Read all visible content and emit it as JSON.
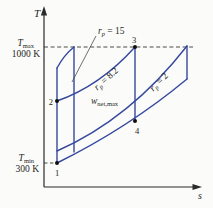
{
  "figure": {
    "background": "#fbfbf9",
    "line_blue": "#35489e",
    "axis_color": "#2b2b2b",
    "axis": {
      "y_label": "T",
      "x_label": "s"
    },
    "tmax": {
      "sym": "T",
      "sub": "max",
      "value": "1000 K"
    },
    "tmin": {
      "sym": "T",
      "sub": "min",
      "value": "300 K"
    },
    "labels": {
      "rp15": {
        "sym": "r",
        "sub": "p",
        "rest": " = 15"
      },
      "rp82": {
        "sym": "r",
        "sub": "p",
        "rest": " = 8.2"
      },
      "rp2": {
        "sym": "r",
        "sub": "p",
        "rest": " = 2"
      },
      "wnet": {
        "sym": "w",
        "sub": "net,max"
      }
    },
    "points": {
      "p1": "1",
      "p2": "2",
      "p3": "3",
      "p4": "4"
    }
  }
}
